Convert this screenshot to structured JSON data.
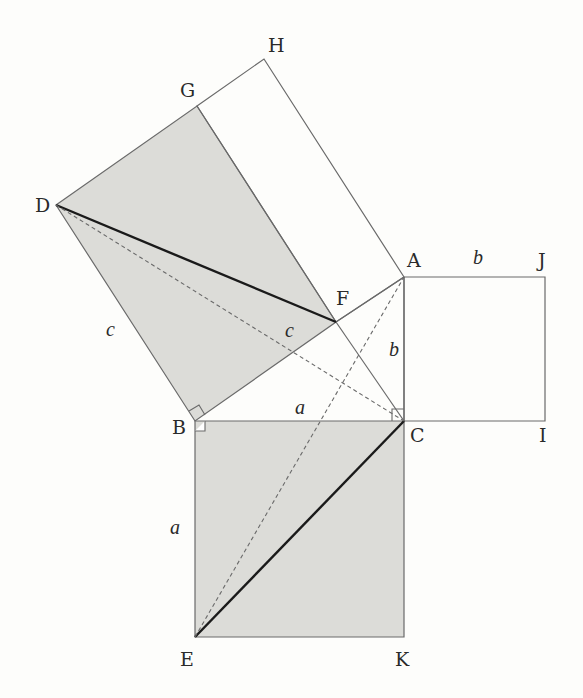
{
  "colors": {
    "background": "#fdfdfb",
    "shade": "#dcdcd8",
    "line": "#6a6a6a",
    "bold": "#1a1a1a",
    "text": "#2a2a2a"
  },
  "points": {
    "A": {
      "label": "A",
      "x": 404,
      "y": 277
    },
    "B": {
      "label": "B",
      "x": 195,
      "y": 421
    },
    "C": {
      "label": "C",
      "x": 404,
      "y": 421
    },
    "D": {
      "label": "D",
      "x": 56,
      "y": 205
    },
    "E": {
      "label": "E",
      "x": 195,
      "y": 637
    },
    "F": {
      "label": "F",
      "x": 336,
      "y": 322
    },
    "G": {
      "label": "G",
      "x": 197,
      "y": 106
    },
    "H": {
      "label": "H",
      "x": 264,
      "y": 59
    },
    "I": {
      "label": "I",
      "x": 545,
      "y": 421
    },
    "J": {
      "label": "J",
      "x": 545,
      "y": 277
    },
    "K": {
      "label": "K",
      "x": 404,
      "y": 637
    }
  },
  "side_labels": {
    "a_bc": "a",
    "a_be": "a",
    "b_ac": "b",
    "b_aj": "b",
    "c_bd": "c",
    "c_bf": "c"
  }
}
